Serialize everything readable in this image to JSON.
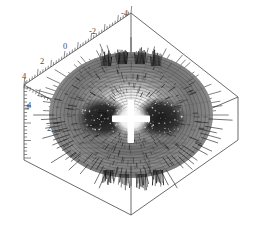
{
  "figure": {
    "type": "surface-3d",
    "background_color": "#ffffff",
    "box_color": "#5a5a5a",
    "surface_light_color": "#b4b4b4",
    "surface_mid_color": "#808080",
    "surface_dark_color": "#2a2a2a",
    "spike_color": "#1c1c1c",
    "highlight_color": "#ffffff"
  },
  "chart_data": {
    "type": "surface",
    "title": "",
    "subtitle": "",
    "xlabel": "",
    "ylabel": "",
    "zlabel": "",
    "grid": false,
    "legend": "none",
    "projection": "3d-box",
    "xlim": [
      -4,
      4
    ],
    "ylim": [
      -4,
      4
    ],
    "zlim": [
      -4,
      4
    ],
    "axes": [
      {
        "name": "x-axis",
        "position": "upper-left-edge",
        "ticks": [
          -4,
          -2,
          0,
          2,
          4
        ],
        "tick_labels": [
          "-4",
          "-2",
          "0",
          "2",
          "4"
        ],
        "minor_ticks": true
      },
      {
        "name": "y-axis",
        "position": "lower-left-edge",
        "ticks": [
          4,
          2
        ],
        "tick_labels": [
          "4",
          "2"
        ],
        "minor_ticks": true
      },
      {
        "name": "z-axis",
        "position": "left-vertical-edge",
        "ticks": [
          4
        ],
        "tick_labels": [
          "4"
        ],
        "minor_ticks": true
      }
    ],
    "tick_labels_x": [
      "-4",
      "-2",
      "0",
      "2",
      "4"
    ],
    "tick_labels_y": [
      "4",
      "2"
    ],
    "tick_labels_z": [
      "4"
    ],
    "series": [
      {
        "name": "spiky-surface",
        "render": "mesh-with-quills",
        "radial_spokes": 96,
        "latitude_bands": 22
      }
    ]
  },
  "axis_labels": {
    "x": [
      {
        "text": "-4",
        "x": 121,
        "y": 16
      },
      {
        "text": "-2",
        "x": 89,
        "y": 34
      },
      {
        "text": "0",
        "x": 63,
        "y": 49
      },
      {
        "text": "2",
        "x": 40,
        "y": 64
      },
      {
        "text": "4",
        "x": 22,
        "y": 79
      }
    ],
    "y": [
      {
        "text": "4",
        "x": 27,
        "y": 108
      },
      {
        "text": "2",
        "x": 47,
        "y": 131
      }
    ],
    "z": [
      {
        "text": "4",
        "x": 25,
        "y": 110
      }
    ]
  }
}
